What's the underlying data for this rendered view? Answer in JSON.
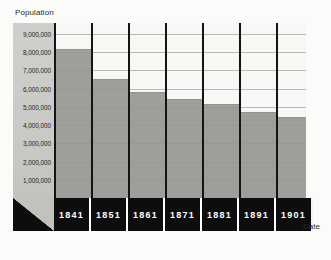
{
  "chart_data": {
    "type": "bar",
    "title": "",
    "subtitle": "",
    "xlabel": "Date",
    "ylabel": "Population",
    "categories": [
      "1841",
      "1851",
      "1861",
      "1871",
      "1881",
      "1891",
      "1901"
    ],
    "values": [
      8180000,
      6550000,
      5800000,
      5410000,
      5170000,
      4700000,
      4460000
    ],
    "series": [
      {
        "name": "Population",
        "values": [
          8180000,
          6550000,
          5800000,
          5410000,
          5170000,
          4700000,
          4460000
        ]
      }
    ],
    "ylim": [
      0,
      9600000
    ],
    "xlim": null,
    "ytick_labels": [
      "9,000,000",
      "8,000,000",
      "7,000,000",
      "6,000,000",
      "5,000,000",
      "4,000,000",
      "3,000,000",
      "2,000,000",
      "1,000,000"
    ],
    "ytick_values": [
      9000000,
      8000000,
      7000000,
      6000000,
      5000000,
      4000000,
      3000000,
      2000000,
      1000000
    ],
    "grid": true,
    "legend": null,
    "legend_position": "none",
    "annotations": []
  },
  "colors": {
    "bar_fill": "#9e9e9a",
    "plot_background": "#f4f4f2",
    "column_background": "#f7f7f5",
    "gridline": "#b9b9b4",
    "separator": "#141414",
    "axis_strip": "#c9c9c5",
    "label_band": "#0d0d0d",
    "label_text": "#ffffff",
    "page_background": "#fbfbf9",
    "text": "#2b2b2b"
  },
  "axis": {
    "y_title": "Population",
    "x_title": "Date"
  }
}
